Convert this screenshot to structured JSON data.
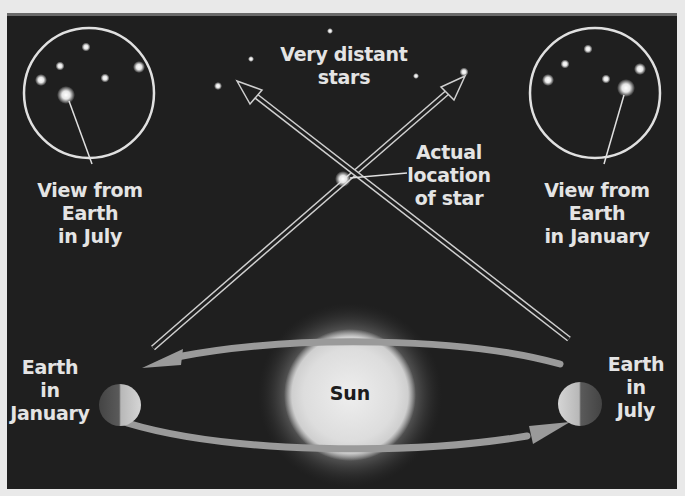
{
  "diagram": {
    "type": "stellar-parallax-illustration",
    "colors": {
      "page_background": "#e9e9e9",
      "panel_background": "#1f1f1f",
      "panel_top_border": "#6a6a6a",
      "label_text": "#e4e4e4",
      "sun_text": "#1c1c1c",
      "orbit_arrow": "#9a9a9a",
      "star": "#f2f2f2"
    },
    "labels": {
      "distant_stars": [
        "Very distant",
        "stars"
      ],
      "actual_star": [
        "Actual",
        "location",
        "of star"
      ],
      "view_july": [
        "View from",
        "Earth",
        "in July"
      ],
      "view_january": [
        "View from",
        "Earth",
        "in January"
      ],
      "earth_january": [
        "Earth",
        "in",
        "January"
      ],
      "earth_july": [
        "Earth",
        "in",
        "July"
      ],
      "sun": "Sun"
    },
    "icons": {
      "sun": "sun-icon",
      "earth_january": "earth-icon",
      "earth_july": "earth-icon",
      "view_circle_july": "telescope-view-icon",
      "view_circle_january": "telescope-view-icon",
      "actual_star": "star-icon"
    }
  }
}
